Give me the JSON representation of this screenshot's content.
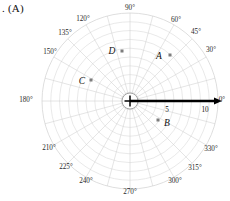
{
  "figure": {
    "caption": ". (A)",
    "type": "polar-plot"
  },
  "colors": {
    "grid": "#d6d6d6",
    "spoke": "#cfcfcf",
    "axis": "#000000",
    "marker": "#7d7d7d",
    "text": "#1a1a1a",
    "background": "#ffffff"
  },
  "polar": {
    "center_x": 130,
    "center_y": 101,
    "outer_radius": 88,
    "hub_radius": 8,
    "ring_count": 10,
    "spoke_step_deg": 15,
    "angle_labels": [
      {
        "text": "0°",
        "deg": 0,
        "x": 222,
        "y": 100
      },
      {
        "text": "30°",
        "deg": 30,
        "x": 211,
        "y": 50
      },
      {
        "text": "45°",
        "deg": 45,
        "x": 196,
        "y": 32
      },
      {
        "text": "60°",
        "deg": 60,
        "x": 176,
        "y": 20
      },
      {
        "text": "90°",
        "deg": 90,
        "x": 130,
        "y": 8
      },
      {
        "text": "120°",
        "deg": 120,
        "x": 83,
        "y": 19
      },
      {
        "text": "135°",
        "deg": 135,
        "x": 65,
        "y": 33
      },
      {
        "text": "150°",
        "deg": 150,
        "x": 50,
        "y": 52
      },
      {
        "text": "180°",
        "deg": 180,
        "x": 26,
        "y": 100
      },
      {
        "text": "210°",
        "deg": 210,
        "x": 49,
        "y": 148
      },
      {
        "text": "225°",
        "deg": 225,
        "x": 66,
        "y": 167
      },
      {
        "text": "240°",
        "deg": 240,
        "x": 86,
        "y": 181
      },
      {
        "text": "270°",
        "deg": 270,
        "x": 130,
        "y": 192
      },
      {
        "text": "300°",
        "deg": 300,
        "x": 175,
        "y": 181
      },
      {
        "text": "315°",
        "deg": 315,
        "x": 195,
        "y": 168
      },
      {
        "text": "330°",
        "deg": 330,
        "x": 211,
        "y": 149
      }
    ],
    "radial_labels": [
      {
        "text": "5",
        "value": 5,
        "x": 167,
        "y": 110
      },
      {
        "text": "10",
        "value": 10,
        "x": 205,
        "y": 110
      }
    ],
    "axis_arrow": {
      "from_r": 0,
      "to_r": 92,
      "deg": 0
    }
  },
  "chart_data": {
    "type": "scatter",
    "title": "",
    "xlabel": "",
    "ylabel": "",
    "coordinate_system": "polar",
    "r_range": [
      0,
      10
    ],
    "theta_range_deg": [
      0,
      360
    ],
    "grid": true,
    "legend": "none",
    "points": [
      {
        "label": "A",
        "r": 6.5,
        "theta_deg": 38,
        "label_x": 159,
        "label_y": 56,
        "marker_x": 170,
        "marker_y": 55
      },
      {
        "label": "B",
        "r": 3.0,
        "theta_deg": 315,
        "label_x": 167,
        "label_y": 123,
        "marker_x": 158,
        "marker_y": 120
      },
      {
        "label": "C",
        "r": 5.5,
        "theta_deg": 148,
        "label_x": 82,
        "label_y": 81,
        "marker_x": 91,
        "marker_y": 80
      },
      {
        "label": "D",
        "r": 6.2,
        "theta_deg": 106,
        "label_x": 112,
        "label_y": 51,
        "marker_x": 122,
        "marker_y": 51
      }
    ]
  }
}
